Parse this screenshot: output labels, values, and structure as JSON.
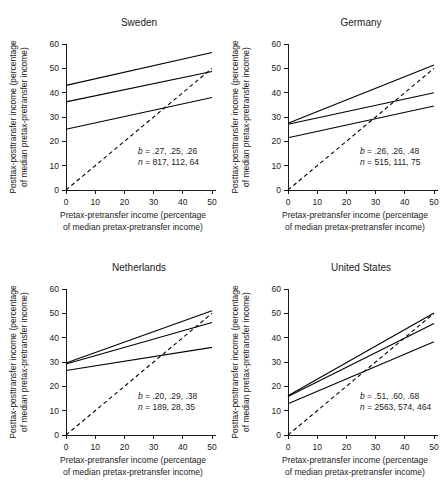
{
  "figure": {
    "background": "#ffffff",
    "ink_color": "#1a1a1a",
    "panel_count": 4
  },
  "axes_common": {
    "xlabel_line1": "Pretax-pretransfer income (percentage",
    "xlabel_line2": "of median pretax-pretransfer income)",
    "ylabel_line1": "Posttax-posttransfer income (percentage",
    "ylabel_line2": "of median pretax-pretransfer income)",
    "x_ticks": [
      "0",
      "10",
      "20",
      "30",
      "40",
      "50"
    ],
    "y_ticks": [
      "0",
      "10",
      "20",
      "30",
      "40",
      "50",
      "60"
    ],
    "xlim": [
      0,
      50
    ],
    "ylim": [
      0,
      60
    ],
    "grid": "off",
    "legend": "none"
  },
  "panels": [
    {
      "id": "sweden",
      "title": "Sweden",
      "b_label": "b = .27, .25, .26",
      "n_label": "n = 817, 112, 64",
      "b_values": [
        0.27,
        0.25,
        0.26
      ],
      "n_values": [
        817,
        112,
        64
      ],
      "lines": [
        {
          "name": "line-upper",
          "intercept": 43.0,
          "slope": 0.27,
          "x0": 0,
          "x1": 50
        },
        {
          "name": "line-middle",
          "intercept": 36.2,
          "slope": 0.25,
          "x0": 0,
          "x1": 50
        },
        {
          "name": "line-lower",
          "intercept": 25.0,
          "slope": 0.26,
          "x0": 0,
          "x1": 50
        }
      ],
      "reference_line": {
        "name": "diagonal-reference",
        "intercept": 0,
        "slope": 1.0,
        "x0": 0,
        "x1": 50,
        "style": "dashed"
      }
    },
    {
      "id": "germany",
      "title": "Germany",
      "b_label": "b = .26, .26, .48",
      "n_label": "n = 515, 111, 75",
      "b_values": [
        0.26,
        0.26,
        0.48
      ],
      "n_values": [
        515,
        111,
        75
      ],
      "lines": [
        {
          "name": "line-upper",
          "intercept": 27.4,
          "slope": 0.48,
          "x0": 0,
          "x1": 50
        },
        {
          "name": "line-middle",
          "intercept": 27.0,
          "slope": 0.26,
          "x0": 0,
          "x1": 50
        },
        {
          "name": "line-lower",
          "intercept": 21.5,
          "slope": 0.26,
          "x0": 0,
          "x1": 50
        }
      ],
      "reference_line": {
        "name": "diagonal-reference",
        "intercept": 0,
        "slope": 1.0,
        "x0": 0,
        "x1": 50,
        "style": "dashed"
      }
    },
    {
      "id": "netherlands",
      "title": "Netherlands",
      "b_label": "b = .20, .29, .38",
      "n_label": "n = 189, 28, 35",
      "b_values": [
        0.2,
        0.29,
        0.38
      ],
      "n_values": [
        189,
        28,
        35
      ],
      "lines": [
        {
          "name": "line-upper",
          "intercept": 29.6,
          "slope": 0.43,
          "x0": 0,
          "x1": 50
        },
        {
          "name": "line-middle",
          "intercept": 29.2,
          "slope": 0.34,
          "x0": 0,
          "x1": 50
        },
        {
          "name": "line-lower",
          "intercept": 26.5,
          "slope": 0.19,
          "x0": 0,
          "x1": 50
        }
      ],
      "reference_line": {
        "name": "diagonal-reference",
        "intercept": 0,
        "slope": 1.0,
        "x0": 0,
        "x1": 50,
        "style": "dashed"
      }
    },
    {
      "id": "united-states",
      "title": "United States",
      "b_label": "b = .51, .60, .68",
      "n_label": "n = 2563, 574, 464",
      "b_values": [
        0.51,
        0.6,
        0.68
      ],
      "n_values": [
        2563,
        574,
        464
      ],
      "lines": [
        {
          "name": "line-upper",
          "intercept": 16.1,
          "slope": 0.68,
          "x0": 0,
          "x1": 50
        },
        {
          "name": "line-middle",
          "intercept": 15.8,
          "slope": 0.6,
          "x0": 0,
          "x1": 50
        },
        {
          "name": "line-lower",
          "intercept": 12.8,
          "slope": 0.51,
          "x0": 0,
          "x1": 50
        }
      ],
      "reference_line": {
        "name": "diagonal-reference",
        "intercept": 0,
        "slope": 1.0,
        "x0": 0,
        "x1": 50,
        "style": "dashed"
      }
    }
  ],
  "chart_data": {
    "type": "line",
    "title": "",
    "subplots": [
      {
        "title": "Sweden",
        "xlabel": "Pretax-pretransfer income (percentage of median pretax-pretransfer income)",
        "ylabel": "Posttax-posttransfer income (percentage of median pretax-pretransfer income)",
        "xlim": [
          0,
          60
        ],
        "ylim": [
          0,
          60
        ],
        "xticks": [
          0,
          10,
          20,
          30,
          40,
          50
        ],
        "yticks": [
          0,
          10,
          20,
          30,
          40,
          50,
          60
        ],
        "grid": false,
        "legend": "none",
        "annotations": [
          "b = .27, .25, .26",
          "n = 817, 112, 64"
        ],
        "series": [
          {
            "name": "group-1-upper",
            "slope": 0.27,
            "intercept": 43.0,
            "x": [
              0,
              50
            ],
            "values": [
              43.0,
              56.5
            ]
          },
          {
            "name": "group-2-middle",
            "slope": 0.25,
            "intercept": 36.2,
            "x": [
              0,
              50
            ],
            "values": [
              36.2,
              48.7
            ]
          },
          {
            "name": "group-3-lower",
            "slope": 0.26,
            "intercept": 25.0,
            "x": [
              0,
              50
            ],
            "values": [
              25.0,
              38.0
            ]
          },
          {
            "name": "reference-diagonal",
            "slope": 1.0,
            "intercept": 0,
            "x": [
              0,
              50
            ],
            "values": [
              0,
              50
            ],
            "style": "dashed"
          }
        ]
      },
      {
        "title": "Germany",
        "xlabel": "Pretax-pretransfer income (percentage of median pretax-pretransfer income)",
        "ylabel": "Posttax-posttransfer income (percentage of median pretax-pretransfer income)",
        "xlim": [
          0,
          60
        ],
        "ylim": [
          0,
          60
        ],
        "xticks": [
          0,
          10,
          20,
          30,
          40,
          50
        ],
        "yticks": [
          0,
          10,
          20,
          30,
          40,
          50,
          60
        ],
        "grid": false,
        "legend": "none",
        "annotations": [
          "b = .26, .26, .48",
          "n = 515, 111, 75"
        ],
        "series": [
          {
            "name": "group-1-steep",
            "slope": 0.48,
            "intercept": 27.4,
            "x": [
              0,
              50
            ],
            "values": [
              27.4,
              51.4
            ]
          },
          {
            "name": "group-2-middle",
            "slope": 0.26,
            "intercept": 27.0,
            "x": [
              0,
              50
            ],
            "values": [
              27.0,
              40.0
            ]
          },
          {
            "name": "group-3-lower",
            "slope": 0.26,
            "intercept": 21.5,
            "x": [
              0,
              50
            ],
            "values": [
              21.5,
              34.5
            ]
          },
          {
            "name": "reference-diagonal",
            "slope": 1.0,
            "intercept": 0,
            "x": [
              0,
              50
            ],
            "values": [
              0,
              50
            ],
            "style": "dashed"
          }
        ]
      },
      {
        "title": "Netherlands",
        "xlabel": "Pretax-pretransfer income (percentage of median pretax-pretransfer income)",
        "ylabel": "Posttax-posttransfer income (percentage of median pretax-pretransfer income)",
        "xlim": [
          0,
          60
        ],
        "ylim": [
          0,
          60
        ],
        "grid": false,
        "legend": "none",
        "annotations": [
          "b = .20, .29, .38",
          "n = 189, 28, 35"
        ],
        "series": [
          {
            "name": "group-1-steep",
            "slope": 0.43,
            "intercept": 29.6,
            "x": [
              0,
              50
            ],
            "values": [
              29.6,
              51.0
            ]
          },
          {
            "name": "group-2-middle",
            "slope": 0.34,
            "intercept": 29.2,
            "x": [
              0,
              50
            ],
            "values": [
              29.2,
              46.0
            ]
          },
          {
            "name": "group-3-lower",
            "slope": 0.19,
            "intercept": 26.5,
            "x": [
              0,
              50
            ],
            "values": [
              26.5,
              36.0
            ]
          },
          {
            "name": "reference-diagonal",
            "slope": 1.0,
            "intercept": 0,
            "x": [
              0,
              50
            ],
            "values": [
              0,
              50
            ],
            "style": "dashed"
          }
        ]
      },
      {
        "title": "United States",
        "xlabel": "Pretax-pretransfer income (percentage of median pretax-pretransfer income)",
        "ylabel": "Posttax-posttransfer income (percentage of median pretax-pretransfer income)",
        "xlim": [
          0,
          60
        ],
        "ylim": [
          0,
          60
        ],
        "grid": false,
        "legend": "none",
        "annotations": [
          "b = .51, .60, .68",
          "n = 2563, 574, 464"
        ],
        "series": [
          {
            "name": "group-1-steep",
            "slope": 0.68,
            "intercept": 16.1,
            "x": [
              0,
              50
            ],
            "values": [
              16.1,
              50.1
            ]
          },
          {
            "name": "group-2-middle",
            "slope": 0.6,
            "intercept": 15.8,
            "x": [
              0,
              50
            ],
            "values": [
              15.8,
              45.8
            ]
          },
          {
            "name": "group-3-lower",
            "slope": 0.51,
            "intercept": 12.8,
            "x": [
              0,
              50
            ],
            "values": [
              12.8,
              38.3
            ]
          },
          {
            "name": "reference-diagonal",
            "slope": 1.0,
            "intercept": 0,
            "x": [
              0,
              50
            ],
            "values": [
              0,
              50
            ],
            "style": "dashed"
          }
        ]
      }
    ]
  }
}
